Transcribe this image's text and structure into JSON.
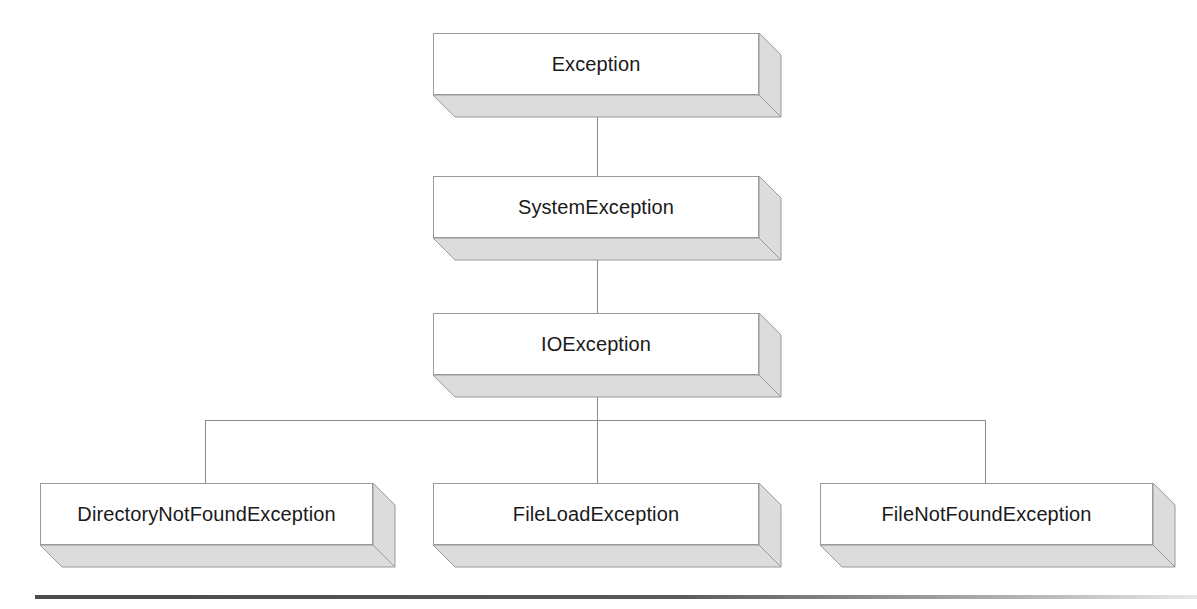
{
  "diagram": {
    "type": "class-hierarchy-tree",
    "style": {
      "box_face_color": "#ffffff",
      "box_depth_color": "#dcdcdc",
      "box_border_color": "#9a9a9a",
      "connector_color": "#8a8a8a",
      "text_color": "#1a1a1a",
      "background_color": "#ffffff",
      "rule_color": "#4a4a4a"
    },
    "nodes": [
      {
        "id": "exception",
        "label": "Exception",
        "level": 0,
        "x": 433,
        "y": 33,
        "width": 326,
        "height": 62,
        "depth": 22
      },
      {
        "id": "system-exception",
        "label": "SystemException",
        "level": 1,
        "x": 433,
        "y": 176,
        "width": 326,
        "height": 62,
        "depth": 22
      },
      {
        "id": "io-exception",
        "label": "IOException",
        "level": 2,
        "x": 433,
        "y": 313,
        "width": 326,
        "height": 62,
        "depth": 22
      },
      {
        "id": "directory-not-found-exception",
        "label": "DirectoryNotFoundException",
        "level": 3,
        "x": 40,
        "y": 483,
        "width": 333,
        "height": 62,
        "depth": 22
      },
      {
        "id": "file-load-exception",
        "label": "FileLoadException",
        "level": 3,
        "x": 433,
        "y": 483,
        "width": 326,
        "height": 62,
        "depth": 22
      },
      {
        "id": "file-not-found-exception",
        "label": "FileNotFoundException",
        "level": 3,
        "x": 820,
        "y": 483,
        "width": 333,
        "height": 62,
        "depth": 22
      }
    ],
    "edges": [
      {
        "id": "edge-exception-to-systemexception",
        "from": "exception",
        "to": "system-exception"
      },
      {
        "id": "edge-systemexception-to-ioexception",
        "from": "system-exception",
        "to": "io-exception"
      },
      {
        "id": "edge-ioexception-to-directorynotfoundexception",
        "from": "io-exception",
        "to": "directory-not-found-exception"
      },
      {
        "id": "edge-ioexception-to-fileloadexception",
        "from": "io-exception",
        "to": "file-load-exception"
      },
      {
        "id": "edge-ioexception-to-filenotfoundexception",
        "from": "io-exception",
        "to": "file-not-found-exception"
      }
    ],
    "connectors": {
      "trunk_x": 597,
      "branch_bus_y": 420,
      "branch_left_x": 205,
      "branch_right_x": 985,
      "segments": [
        {
          "id": "trunk-exception-systemexception",
          "orientation": "vertical",
          "x": 597,
          "y1": 95,
          "y2": 176
        },
        {
          "id": "trunk-systemexception-ioexception",
          "orientation": "vertical",
          "x": 597,
          "y1": 238,
          "y2": 313
        },
        {
          "id": "trunk-ioexception-to-bus",
          "orientation": "vertical",
          "x": 597,
          "y1": 375,
          "y2": 420
        },
        {
          "id": "branch-bus",
          "orientation": "horizontal",
          "y": 420,
          "x1": 205,
          "x2": 985
        },
        {
          "id": "drop-directorynotfoundexception",
          "orientation": "vertical",
          "x": 205,
          "y1": 420,
          "y2": 483
        },
        {
          "id": "drop-fileloadexception",
          "orientation": "vertical",
          "x": 597,
          "y1": 420,
          "y2": 483
        },
        {
          "id": "drop-filenotfoundexception",
          "orientation": "vertical",
          "x": 985,
          "y1": 420,
          "y2": 483
        }
      ]
    },
    "bottom_rule": {
      "x": 35,
      "y": 595,
      "width": 1162,
      "height": 4
    }
  }
}
